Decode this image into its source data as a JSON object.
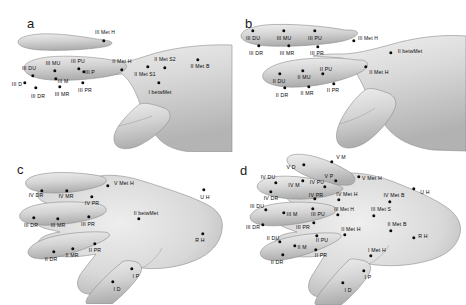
{
  "figure": {
    "background_color": "#ffffff",
    "marker_color": "#0d0d0d",
    "label_color": "#0a0a0a",
    "skin_color": "#d8d8d8",
    "width": 466,
    "height": 305
  },
  "panels": [
    {
      "id": "a",
      "letter": "a",
      "letter_pos": [
        27,
        16
      ],
      "view": "dorsal-radial hand with extended index finger",
      "markers": [
        {
          "name": "III Met H",
          "label": "III Met H",
          "lx": 105,
          "ly": 32,
          "px": 104,
          "py": 41
        },
        {
          "name": "III PU",
          "label": "III PU",
          "lx": 78,
          "ly": 61,
          "px": 79,
          "py": 69
        },
        {
          "name": "III MU",
          "label": "III MU",
          "lx": 53,
          "ly": 63,
          "px": 55,
          "py": 71
        },
        {
          "name": "III DU",
          "label": "III DU",
          "lx": 29,
          "ly": 68,
          "px": 33,
          "py": 76
        },
        {
          "name": "III D",
          "label": "III D",
          "lx": 17,
          "ly": 84,
          "px": 25,
          "py": 83
        },
        {
          "name": "III M",
          "label": "III M",
          "lx": 63,
          "ly": 81,
          "px": 56,
          "py": 79
        },
        {
          "name": "III P",
          "label": "III P",
          "lx": 90,
          "ly": 72,
          "px": 84,
          "py": 72
        },
        {
          "name": "III DR",
          "label": "III DR",
          "lx": 38,
          "ly": 96,
          "px": 36,
          "py": 88
        },
        {
          "name": "III MR",
          "label": "III MR",
          "lx": 62,
          "ly": 94,
          "px": 60,
          "py": 87
        },
        {
          "name": "III PR",
          "label": "III PR",
          "lx": 85,
          "ly": 90,
          "px": 83,
          "py": 83
        },
        {
          "name": "II Met H",
          "label": "II Met H",
          "lx": 122,
          "ly": 61,
          "px": 122,
          "py": 70
        },
        {
          "name": "II Met S1",
          "label": "II Met S1",
          "lx": 145,
          "ly": 74,
          "px": 148,
          "py": 67
        },
        {
          "name": "II Met S2",
          "label": "II Met S2",
          "lx": 165,
          "ly": 59,
          "px": 165,
          "py": 68
        },
        {
          "name": "II Met B",
          "label": "II Met B",
          "lx": 200,
          "ly": 66,
          "px": 198,
          "py": 60
        },
        {
          "name": "I betwMet",
          "label": "I betwMet",
          "lx": 160,
          "ly": 92,
          "px": 159,
          "py": 83
        }
      ]
    },
    {
      "id": "b",
      "letter": "b",
      "letter_pos": [
        12,
        16
      ],
      "view": "dorsal-radial hand with index and middle fingers extended",
      "markers": [
        {
          "name": "III DU",
          "label": "III DU",
          "lx": 20,
          "ly": 38,
          "px": 20,
          "py": 31
        },
        {
          "name": "III MU",
          "label": "III MU",
          "lx": 51,
          "ly": 38,
          "px": 51,
          "py": 31
        },
        {
          "name": "III PU",
          "label": "III PU",
          "lx": 82,
          "ly": 38,
          "px": 82,
          "py": 31
        },
        {
          "name": "III DR",
          "label": "III DR",
          "lx": 23,
          "ly": 53,
          "px": 26,
          "py": 46
        },
        {
          "name": "III MR",
          "label": "III MR",
          "lx": 54,
          "ly": 53,
          "px": 56,
          "py": 46
        },
        {
          "name": "III PR",
          "label": "III PR",
          "lx": 84,
          "ly": 53,
          "px": 85,
          "py": 47
        },
        {
          "name": "III Met H",
          "label": "III Met H",
          "lx": 135,
          "ly": 38,
          "px": 121,
          "py": 41
        },
        {
          "name": "II betwMet",
          "label": "II betwMet",
          "lx": 177,
          "ly": 51,
          "px": 158,
          "py": 53
        },
        {
          "name": "II PU",
          "label": "II PU",
          "lx": 93,
          "ly": 69,
          "px": 90,
          "py": 74
        },
        {
          "name": "II MU",
          "label": "II MU",
          "lx": 71,
          "ly": 77,
          "px": 70,
          "py": 71
        },
        {
          "name": "II DU",
          "label": "II DU",
          "lx": 46,
          "ly": 81,
          "px": 47,
          "py": 74
        },
        {
          "name": "II DR",
          "label": "II DR",
          "lx": 49,
          "ly": 95,
          "px": 52,
          "py": 88
        },
        {
          "name": "II MR",
          "label": "II MR",
          "lx": 74,
          "ly": 93,
          "px": 76,
          "py": 87
        },
        {
          "name": "II PR",
          "label": "II PR",
          "lx": 100,
          "ly": 90,
          "px": 101,
          "py": 84
        },
        {
          "name": "II Met H",
          "label": "II Met H",
          "lx": 146,
          "ly": 72,
          "px": 133,
          "py": 67
        }
      ]
    },
    {
      "id": "c",
      "letter": "c",
      "letter_pos": [
        17,
        10
      ],
      "view": "dorsal hand, radial-side landmarks on fingers II-V",
      "markers": [
        {
          "name": "V Met H",
          "label": "V Met H",
          "lx": 124,
          "ly": 31,
          "px": 108,
          "py": 34
        },
        {
          "name": "IV DR",
          "label": "IV DR",
          "lx": 36,
          "ly": 43,
          "px": 42,
          "py": 39
        },
        {
          "name": "IV MR",
          "label": "IV MR",
          "lx": 66,
          "ly": 44,
          "px": 67,
          "py": 39
        },
        {
          "name": "IV PR",
          "label": "IV PR",
          "lx": 92,
          "ly": 51,
          "px": 92,
          "py": 45
        },
        {
          "name": "U H",
          "label": "U H",
          "lx": 205,
          "ly": 45,
          "px": 204,
          "py": 38
        },
        {
          "name": "III DR",
          "label": "III DR",
          "lx": 31,
          "ly": 73,
          "px": 34,
          "py": 66
        },
        {
          "name": "III MR",
          "label": "III MR",
          "lx": 58,
          "ly": 73,
          "px": 58,
          "py": 67
        },
        {
          "name": "III PR",
          "label": "III PR",
          "lx": 88,
          "ly": 72,
          "px": 89,
          "py": 65
        },
        {
          "name": "II betwMet",
          "label": "II betwMet",
          "lx": 146,
          "ly": 61,
          "px": 139,
          "py": 67
        },
        {
          "name": "II DR",
          "label": "II DR",
          "lx": 51,
          "ly": 107,
          "px": 54,
          "py": 100
        },
        {
          "name": "II MR",
          "label": "II MR",
          "lx": 72,
          "ly": 103,
          "px": 73,
          "py": 97
        },
        {
          "name": "II PR",
          "label": "II PR",
          "lx": 95,
          "ly": 98,
          "px": 95,
          "py": 92
        },
        {
          "name": "R H",
          "label": "R H",
          "lx": 200,
          "ly": 88,
          "px": 203,
          "py": 82
        },
        {
          "name": "I P",
          "label": "I P",
          "lx": 136,
          "ly": 124,
          "px": 132,
          "py": 117
        },
        {
          "name": "I D",
          "label": "I D",
          "lx": 117,
          "ly": 137,
          "px": 113,
          "py": 130
        }
      ]
    },
    {
      "id": "d",
      "letter": "d",
      "letter_pos": [
        7,
        10
      ],
      "view": "dorsal hand, full landmark set on all digits and metacarpals",
      "markers": [
        {
          "name": "V M",
          "label": "V M",
          "lx": 108,
          "ly": 4,
          "px": 99,
          "py": 9
        },
        {
          "name": "V D",
          "label": "V D",
          "lx": 58,
          "ly": 14,
          "px": 71,
          "py": 12
        },
        {
          "name": "V P",
          "label": "V P",
          "lx": 96,
          "ly": 23,
          "px": 103,
          "py": 28
        },
        {
          "name": "IV DU",
          "label": "IV DU",
          "lx": 35,
          "ly": 24,
          "px": 43,
          "py": 30
        },
        {
          "name": "IV M",
          "label": "IV M",
          "lx": 61,
          "ly": 32,
          "px": 70,
          "py": 28
        },
        {
          "name": "IV PU",
          "label": "IV PU",
          "lx": 84,
          "ly": 29,
          "px": 92,
          "py": 34
        },
        {
          "name": "V Met H",
          "label": "V Met H",
          "lx": 139,
          "ly": 25,
          "px": 126,
          "py": 24
        },
        {
          "name": "IV DR",
          "label": "IV DR",
          "lx": 38,
          "ly": 45,
          "px": 38,
          "py": 39
        },
        {
          "name": "IV PR",
          "label": "IV PR",
          "lx": 83,
          "ly": 42,
          "px": 82,
          "py": 46
        },
        {
          "name": "IV Met H",
          "label": "IV Met H",
          "lx": 114,
          "ly": 41,
          "px": 106,
          "py": 47
        },
        {
          "name": "IV Met B",
          "label": "IV Met B",
          "lx": 161,
          "ly": 42,
          "px": 157,
          "py": 49
        },
        {
          "name": "U H",
          "label": "U H",
          "lx": 192,
          "ly": 39,
          "px": 181,
          "py": 36
        },
        {
          "name": "III DU",
          "label": "III DU",
          "lx": 24,
          "ly": 53,
          "px": 33,
          "py": 57
        },
        {
          "name": "III M",
          "label": "III M",
          "lx": 59,
          "ly": 61,
          "px": 51,
          "py": 60
        },
        {
          "name": "III PU",
          "label": "III PU",
          "lx": 85,
          "ly": 61,
          "px": 80,
          "py": 56
        },
        {
          "name": "III Met H",
          "label": "III Met H",
          "lx": 111,
          "ly": 56,
          "px": 105,
          "py": 62
        },
        {
          "name": "III Met S",
          "label": "III Met S",
          "lx": 148,
          "ly": 56,
          "px": 141,
          "py": 63
        },
        {
          "name": "III DR",
          "label": "III DR",
          "lx": 20,
          "ly": 74,
          "px": 30,
          "py": 72
        },
        {
          "name": "III PR",
          "label": "III PR",
          "lx": 70,
          "ly": 74,
          "px": 81,
          "py": 70
        },
        {
          "name": "II Met H",
          "label": "II Met H",
          "lx": 118,
          "ly": 76,
          "px": 112,
          "py": 82
        },
        {
          "name": "II Met B",
          "label": "II Met B",
          "lx": 164,
          "ly": 71,
          "px": 158,
          "py": 78
        },
        {
          "name": "II DU",
          "label": "II DU",
          "lx": 40,
          "ly": 85,
          "px": 47,
          "py": 89
        },
        {
          "name": "II M",
          "label": "II M",
          "lx": 69,
          "ly": 94,
          "px": 62,
          "py": 93
        },
        {
          "name": "II PU",
          "label": "II PU",
          "lx": 89,
          "ly": 87,
          "px": 84,
          "py": 83
        },
        {
          "name": "R H",
          "label": "R H",
          "lx": 190,
          "ly": 83,
          "px": 181,
          "py": 85
        },
        {
          "name": "II PR",
          "label": "II PR",
          "lx": 88,
          "ly": 102,
          "px": 83,
          "py": 97
        },
        {
          "name": "II DR",
          "label": "II DR",
          "lx": 44,
          "ly": 109,
          "px": 50,
          "py": 102
        },
        {
          "name": "I Met H",
          "label": "I Met H",
          "lx": 144,
          "ly": 97,
          "px": 138,
          "py": 103
        },
        {
          "name": "I P",
          "label": "I P",
          "lx": 135,
          "ly": 124,
          "px": 131,
          "py": 118
        },
        {
          "name": "I D",
          "label": "I D",
          "lx": 115,
          "ly": 137,
          "px": 110,
          "py": 130
        }
      ]
    }
  ]
}
